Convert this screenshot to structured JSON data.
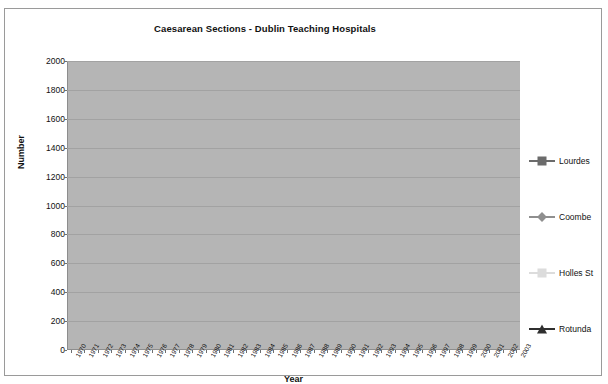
{
  "chart_data": {
    "type": "line",
    "title": "Caesarean Sections - Dublin Teaching Hospitals",
    "xlabel": "Year",
    "ylabel": "Number",
    "grid": true,
    "legend_position": "right",
    "ylim": [
      0,
      2000
    ],
    "ytick_step": 200,
    "yticks": [
      "0",
      "200",
      "400",
      "600",
      "800",
      "1000",
      "1200",
      "1400",
      "1600",
      "1800",
      "2000"
    ],
    "categories": [
      "1970",
      "1971",
      "1972",
      "1973",
      "1974",
      "1975",
      "1976",
      "1977",
      "1978",
      "1979",
      "1980",
      "1981",
      "1982",
      "1983",
      "1984",
      "1985",
      "1986",
      "1987",
      "1988",
      "1989",
      "1990",
      "1991",
      "1992",
      "1993",
      "1994",
      "1995",
      "1996",
      "1997",
      "1998",
      "1999",
      "2000",
      "2001",
      "2002",
      "2003"
    ],
    "series": [
      {
        "name": "Lourdes",
        "color": "#6b6b6b",
        "marker": "square",
        "values": [
          110,
          130,
          120,
          120,
          125,
          130,
          130,
          135,
          140,
          160,
          175,
          185,
          190,
          195,
          235,
          200,
          195,
          200,
          215,
          225,
          235,
          240,
          250,
          250,
          300,
          300,
          330,
          390,
          400,
          490,
          500,
          500,
          750,
          820
        ]
      },
      {
        "name": "Coombe",
        "color": "#8f8f8f",
        "marker": "diamond",
        "values": [
          360,
          380,
          400,
          450,
          520,
          570,
          575,
          580,
          590,
          620,
          640,
          660,
          680,
          670,
          390,
          650,
          680,
          700,
          700,
          730,
          740,
          760,
          790,
          800,
          800,
          810,
          860,
          930,
          1000,
          1010,
          1160,
          1290,
          1390,
          1550
        ]
      },
      {
        "name": "Holles St",
        "color": "#dcdcdc",
        "marker": "square",
        "values": [
          400,
          330,
          300,
          260,
          280,
          330,
          350,
          400,
          420,
          480,
          500,
          510,
          520,
          530,
          440,
          440,
          460,
          470,
          470,
          470,
          480,
          500,
          520,
          520,
          540,
          620,
          690,
          720,
          800,
          830,
          950,
          1090,
          1200,
          1330
        ]
      },
      {
        "name": "Rotunda",
        "color": "#2f2f2f",
        "marker": "triangle",
        "values": [
          370,
          300,
          295,
          375,
          375,
          390,
          470,
          520,
          620,
          500,
          570,
          560,
          510,
          600,
          640,
          650,
          700,
          710,
          700,
          700,
          690,
          870,
          760,
          790,
          800,
          900,
          990,
          1130,
          1330,
          1540,
          1570,
          1620,
          1760,
          1870
        ]
      }
    ]
  },
  "legend": {
    "items": [
      {
        "label": "Lourdes"
      },
      {
        "label": "Coombe"
      },
      {
        "label": "Holles St"
      },
      {
        "label": "Rotunda"
      }
    ]
  }
}
